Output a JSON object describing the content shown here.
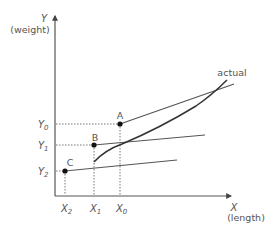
{
  "diagram": {
    "y_axis": {
      "symbol": "Y",
      "label": "(weight)"
    },
    "x_axis": {
      "symbol": "X",
      "label": "(length)"
    },
    "curve_label": "actual",
    "points": [
      {
        "name": "A",
        "x_label": "X",
        "x_sub": "0",
        "y_label": "Y",
        "y_sub": "0"
      },
      {
        "name": "B",
        "x_label": "X",
        "x_sub": "1",
        "y_label": "Y",
        "y_sub": "1"
      },
      {
        "name": "C",
        "x_label": "X",
        "x_sub": "2",
        "y_label": "Y",
        "y_sub": "2"
      }
    ],
    "colors": {
      "axis": "#555555",
      "line": "#555555",
      "curve": "#333333",
      "dotted": "#666666",
      "text": "#555555",
      "point": "#111111"
    }
  }
}
